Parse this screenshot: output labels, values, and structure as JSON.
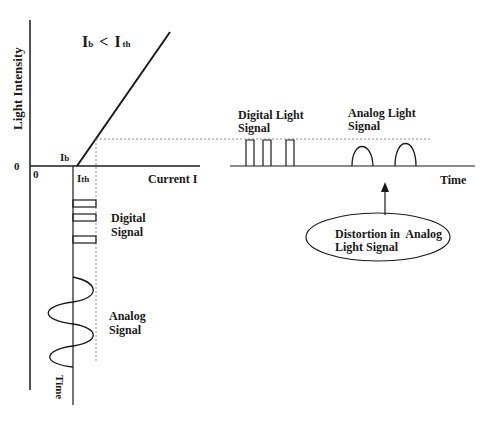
{
  "diagram": {
    "title": {
      "main_left": "I",
      "sub_left": "b",
      "operator": "<",
      "main_right": "I",
      "sub_right": "th"
    },
    "axes": {
      "y_label": "Light Intensity",
      "x_label": "Current I",
      "origin_y": "0",
      "origin_x": "0",
      "bias_label_main": "I",
      "bias_label_sub": "b",
      "threshold_label_main": "I",
      "threshold_label_sub": "th",
      "time_label_vertical": "Time",
      "time_label_right": "Time"
    },
    "input_signals": {
      "digital_label_line1": "Digital",
      "digital_label_line2": "Signal",
      "analog_label_line1": "Analog",
      "analog_label_line2": "Signal"
    },
    "output_signals": {
      "digital_label_line1": "Digital Light",
      "digital_label_line2": "Signal",
      "analog_label_line1": "Analog Light",
      "analog_label_line2": "Signal"
    },
    "callout": {
      "line1": "Distortion in  Analog",
      "line2": "Light Signal"
    }
  }
}
